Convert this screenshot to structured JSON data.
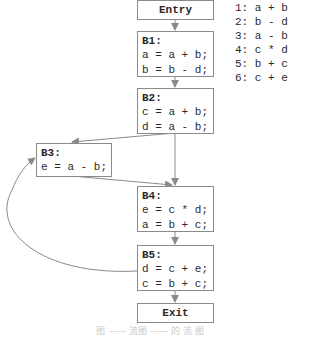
{
  "diagram": {
    "type": "control-flow-graph",
    "entry": {
      "label": "Entry"
    },
    "exit": {
      "label": "Exit"
    },
    "blocks": [
      {
        "id": "B1",
        "label": "B1:",
        "statements": [
          "a = a + b;",
          "b = b - d;"
        ]
      },
      {
        "id": "B2",
        "label": "B2:",
        "statements": [
          "c = a + b;",
          "d = a - b;"
        ]
      },
      {
        "id": "B3",
        "label": "B3:",
        "statements": [
          "e = a - b;"
        ]
      },
      {
        "id": "B4",
        "label": "B4:",
        "statements": [
          "e = c * d;",
          "a = b + c;"
        ]
      },
      {
        "id": "B5",
        "label": "B5:",
        "statements": [
          "d = c + e;",
          "c = b + c;"
        ]
      }
    ],
    "edges": [
      [
        "Entry",
        "B1"
      ],
      [
        "B1",
        "B2"
      ],
      [
        "B2",
        "B3"
      ],
      [
        "B2",
        "B4"
      ],
      [
        "B3",
        "B4"
      ],
      [
        "B4",
        "B5"
      ],
      [
        "B5",
        "B3"
      ],
      [
        "B5",
        "Exit"
      ]
    ],
    "expressions": [
      "1: a + b",
      "2: b - d",
      "3: a - b",
      "4: c * d",
      "5: b + c",
      "6: c + e"
    ],
    "caption": "图 ——  流图 —— 的 流 图"
  }
}
